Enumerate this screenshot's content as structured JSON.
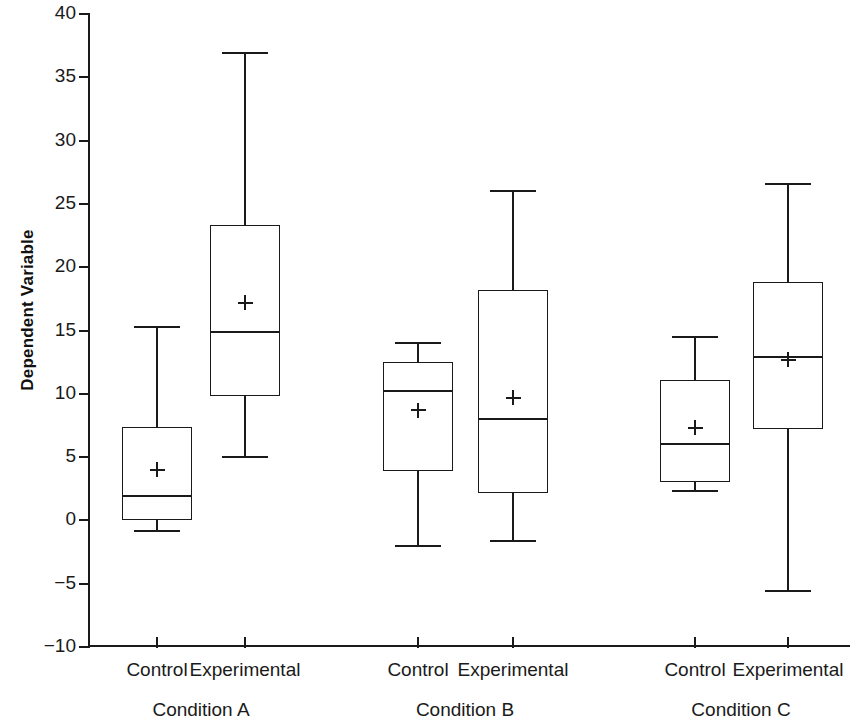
{
  "chart_data": {
    "type": "box",
    "title": "",
    "xlabel": "",
    "ylabel": "Dependent Variable",
    "ylim": [
      -10,
      40
    ],
    "yticks": [
      -10,
      -5,
      0,
      5,
      10,
      15,
      20,
      25,
      30,
      35,
      40
    ],
    "ytick_labels": [
      "−10",
      "−5",
      "0",
      "5",
      "10",
      "15",
      "20",
      "25",
      "30",
      "35",
      "40"
    ],
    "grid": false,
    "legend": "none",
    "mean_marker": "+",
    "groups": [
      {
        "name": "Condition A",
        "boxes": [
          {
            "label": "Control",
            "whisker_low": -0.8,
            "q1": 0.0,
            "median": 1.9,
            "q3": 7.4,
            "whisker_high": 15.3,
            "mean": 4.0
          },
          {
            "label": "Experimental",
            "whisker_low": 5.0,
            "q1": 9.8,
            "median": 14.9,
            "q3": 23.3,
            "whisker_high": 36.9,
            "mean": 17.2
          }
        ]
      },
      {
        "name": "Condition B",
        "boxes": [
          {
            "label": "Control",
            "whisker_low": -2.0,
            "q1": 3.9,
            "median": 10.2,
            "q3": 12.5,
            "whisker_high": 14.0,
            "mean": 8.7
          },
          {
            "label": "Experimental",
            "whisker_low": -1.6,
            "q1": 2.2,
            "median": 8.0,
            "q3": 18.2,
            "whisker_high": 26.0,
            "mean": 9.7
          }
        ]
      },
      {
        "name": "Condition C",
        "boxes": [
          {
            "label": "Control",
            "whisker_low": 2.3,
            "q1": 3.0,
            "median": 6.0,
            "q3": 11.1,
            "whisker_high": 14.5,
            "mean": 7.3
          },
          {
            "label": "Experimental",
            "whisker_low": -5.6,
            "q1": 7.2,
            "median": 12.9,
            "q3": 18.8,
            "whisker_high": 26.6,
            "mean": 12.7
          }
        ]
      }
    ]
  },
  "axis": {
    "y_title": "Dependent Variable"
  },
  "colors": {
    "line": "#1a1a1a",
    "background": "#ffffff"
  }
}
